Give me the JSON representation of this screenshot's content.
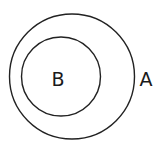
{
  "diagram": {
    "type": "nested-set-diagram",
    "sets": [
      {
        "id": "A",
        "label": "A",
        "role": "outer",
        "contains": [
          "B"
        ]
      },
      {
        "id": "B",
        "label": "B",
        "role": "inner",
        "contained_in": "A"
      }
    ],
    "colors": {
      "stroke": "#222222",
      "text": "#1a1a1a",
      "background": "#ffffff"
    }
  }
}
